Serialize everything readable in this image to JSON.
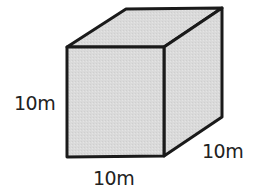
{
  "diagram": {
    "shape": "cube",
    "colors": {
      "fill": "#d9d9d9",
      "stroke": "#1a1a1a",
      "text": "#222222",
      "background": "#ffffff"
    },
    "labels": {
      "height": "10m",
      "width": "10m",
      "depth": "10m"
    }
  }
}
